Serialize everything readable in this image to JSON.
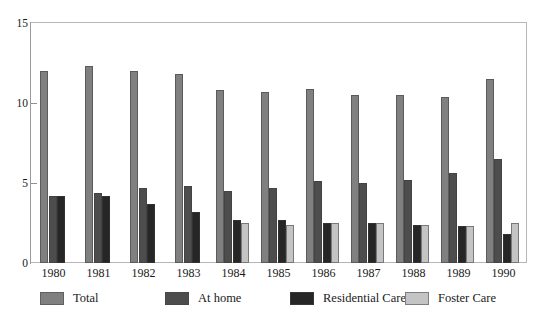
{
  "chart_data": {
    "type": "bar",
    "title": "",
    "xlabel": "",
    "ylabel": "",
    "ylim": [
      0,
      15
    ],
    "yticks": [
      0,
      5,
      10,
      15
    ],
    "grid": false,
    "legend_position": "bottom",
    "categories": [
      "1980",
      "1981",
      "1982",
      "1983",
      "1984",
      "1985",
      "1986",
      "1987",
      "1988",
      "1989",
      "1990"
    ],
    "series": [
      {
        "name": "Total",
        "color": "#808080",
        "values": [
          12.0,
          12.3,
          12.0,
          11.8,
          10.8,
          10.7,
          10.9,
          10.5,
          10.5,
          10.4,
          11.5
        ]
      },
      {
        "name": "At home",
        "color": "#4d4d4d",
        "values": [
          4.2,
          4.4,
          4.7,
          4.8,
          4.5,
          4.7,
          5.1,
          5.0,
          5.2,
          5.6,
          6.5
        ]
      },
      {
        "name": "Residential Care",
        "color": "#262626",
        "values": [
          4.2,
          4.2,
          3.7,
          3.2,
          2.7,
          2.7,
          2.5,
          2.5,
          2.4,
          2.3,
          1.8
        ]
      },
      {
        "name": "Foster Care",
        "color": "#c4c4c4",
        "values": [
          null,
          null,
          null,
          null,
          2.5,
          2.4,
          2.5,
          2.5,
          2.4,
          2.3,
          2.5
        ]
      }
    ]
  },
  "axes": {
    "y_tick_labels": [
      "15",
      "10",
      "5",
      "0"
    ],
    "x_tick_labels": [
      "1980",
      "1981",
      "1982",
      "1983",
      "1984",
      "1985",
      "1986",
      "1987",
      "1988",
      "1989",
      "1990"
    ]
  },
  "legend": {
    "items": [
      {
        "label": "Total",
        "color": "#808080"
      },
      {
        "label": "At home",
        "color": "#4d4d4d"
      },
      {
        "label": "Residential Care",
        "color": "#262626"
      },
      {
        "label": "Foster Care",
        "color": "#c4c4c4"
      }
    ]
  }
}
